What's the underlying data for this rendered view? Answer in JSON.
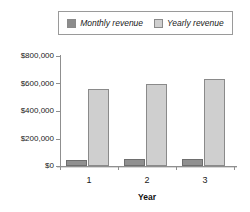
{
  "chart_data": {
    "type": "bar",
    "title": "",
    "xlabel": "Year",
    "ylabel": "",
    "categories": [
      "1",
      "2",
      "3"
    ],
    "series": [
      {
        "name": "Monthly revenue",
        "values": [
          45000,
          48000,
          52000
        ],
        "color": "#909090"
      },
      {
        "name": "Yearly revenue",
        "values": [
          560000,
          595000,
          630000
        ],
        "color": "#cfcfcf"
      }
    ],
    "ylim": [
      0,
      800000
    ],
    "ytick_values": [
      0,
      200000,
      400000,
      600000,
      800000
    ],
    "ytick_labels": [
      "$0",
      "$200,000",
      "$400,000",
      "$600,000",
      "$800,000"
    ],
    "grid": false,
    "legend_position": "top"
  },
  "legend": {
    "entries": [
      {
        "label": "Monthly revenue",
        "swatch": "monthly-swatch"
      },
      {
        "label": "Yearly revenue",
        "swatch": "yearly-swatch"
      }
    ]
  },
  "axes": {
    "x_title": "Year",
    "x_tick_labels": [
      "1",
      "2",
      "3"
    ],
    "y_tick_labels": [
      "$800,000",
      "$600,000",
      "$400,000",
      "$200,000",
      "$0"
    ]
  },
  "colors": {
    "monthly_bar": "#909090",
    "yearly_bar": "#cfcfcf",
    "axis": "#8f8f8f",
    "text": "#1a1a1a",
    "background": "#ffffff"
  }
}
